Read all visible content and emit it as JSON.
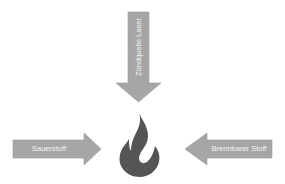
{
  "diagram": {
    "title": "",
    "colors": {
      "arrow_fill": "#a6a6a6",
      "arrow_stroke": "#9a9a9a",
      "flame_fill": "#555555",
      "label_text": "#f4f4f4",
      "background": "#ffffff"
    },
    "nodes": [
      {
        "id": "top",
        "label": "Zündquelle Laser",
        "direction": "down",
        "role": "input"
      },
      {
        "id": "left",
        "label": "Sauerstoff",
        "direction": "right",
        "role": "input"
      },
      {
        "id": "right",
        "label": "Brennbarer Stoff",
        "direction": "left",
        "role": "input"
      },
      {
        "id": "center",
        "icon": "flame-icon",
        "role": "result"
      }
    ]
  }
}
